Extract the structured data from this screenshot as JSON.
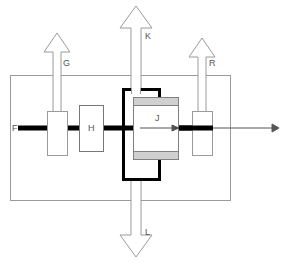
{
  "diagram": {
    "background_color": "#ffffff",
    "colors": {
      "outline_gray": "#9a9a9a",
      "light_gray_band": "#d0d0d0",
      "thick_black": "#000000",
      "label_gray": "#555555",
      "flow_line": "#000000"
    },
    "outer_enclosure": {
      "name": "outer-enclosure",
      "x": 10,
      "y": 75,
      "width": 220,
      "height": 125,
      "stroke": "#9a9a9a",
      "fill": "none"
    },
    "flow_line": {
      "name": "main-flow-line",
      "label": "F",
      "label_x": 12,
      "label_y": 131,
      "y": 128,
      "x_start": 18,
      "x_thick_end": 213,
      "x_arrow_end": 276,
      "thickness": 5
    },
    "arrows": [
      {
        "id": "G",
        "label": "G",
        "label_x": 63,
        "label_y": 66,
        "direction": "up",
        "cx": 57,
        "tip_y": 33,
        "head_half_width": 13,
        "head_height": 19,
        "shaft_half_width": 4,
        "shaft_end_y": 113,
        "style": "hollow-thin"
      },
      {
        "id": "K",
        "label": "K",
        "label_x": 145,
        "label_y": 39,
        "direction": "up",
        "cx": 136,
        "tip_y": 6,
        "head_half_width": 16,
        "head_height": 22,
        "shaft_half_width": 5,
        "shaft_end_y": 92,
        "style": "hollow-thin"
      },
      {
        "id": "R",
        "label": "R",
        "label_x": 209,
        "label_y": 66,
        "direction": "up",
        "cx": 202,
        "tip_y": 38,
        "head_half_width": 13,
        "head_height": 19,
        "shaft_half_width": 4,
        "shaft_end_y": 113,
        "style": "hollow-thin"
      },
      {
        "id": "L",
        "label": "L",
        "label_x": 145,
        "label_y": 235,
        "direction": "down",
        "cx": 136,
        "tip_y": 257,
        "head_half_width": 16,
        "head_height": 22,
        "shaft_half_width": 5,
        "shaft_end_y": 180,
        "style": "hollow-thin"
      }
    ],
    "valve_boxes": [
      {
        "id": "G-valve",
        "name": "valve-box-g",
        "x": 47,
        "y": 111,
        "width": 20,
        "height": 44,
        "stroke": "#9a9a9a",
        "fill": "#ffffff",
        "label": ""
      },
      {
        "id": "H",
        "name": "component-h",
        "x": 79,
        "y": 105,
        "width": 24,
        "height": 46,
        "stroke": "#777777",
        "fill": "#ffffff",
        "label": "H",
        "label_x": 91,
        "label_y": 131
      },
      {
        "id": "R-valve",
        "name": "valve-box-r",
        "x": 192,
        "y": 111,
        "width": 20,
        "height": 44,
        "stroke": "#9a9a9a",
        "fill": "#ffffff",
        "label": ""
      }
    ],
    "main_unit": {
      "name": "main-unit-j",
      "outer": {
        "x": 122,
        "y": 88,
        "width": 38,
        "height": 92,
        "stroke": "#000000",
        "stroke_width": 3,
        "fill": "#ffffff"
      },
      "inner": {
        "x": 133,
        "y": 97,
        "width": 45,
        "height": 63,
        "stroke": "#808080",
        "fill": "#ffffff"
      },
      "bands": [
        {
          "name": "band-top",
          "x": 133,
          "y": 97,
          "width": 45,
          "height": 8,
          "fill": "#d0d0d0"
        },
        {
          "name": "band-bottom",
          "x": 133,
          "y": 152,
          "width": 45,
          "height": 8,
          "fill": "#d0d0d0"
        }
      ],
      "label": "J",
      "label_x": 155,
      "label_y": 121,
      "inner_arrow": {
        "name": "internal-flow-arrow-j",
        "x_start": 140,
        "x_end": 177,
        "y": 128
      }
    }
  }
}
